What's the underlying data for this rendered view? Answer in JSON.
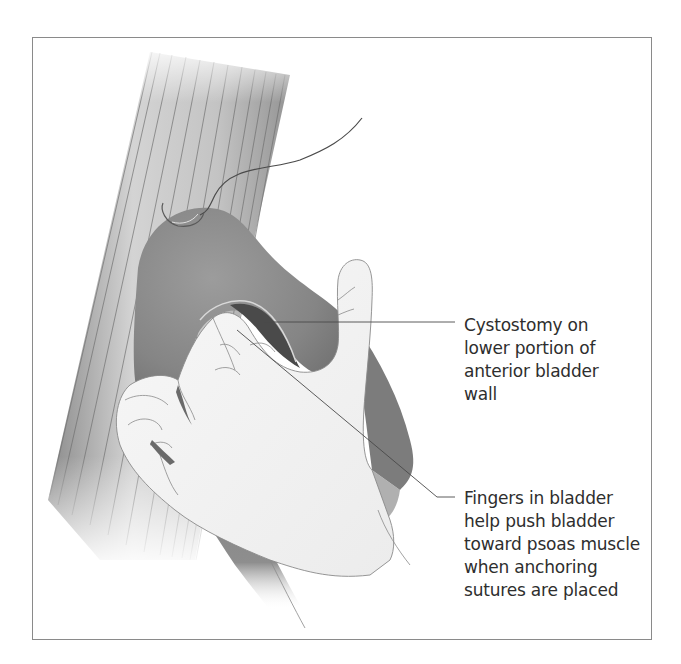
{
  "figure": {
    "colors": {
      "frame_border": "#8a8a8a",
      "muscle_shade": "#9a9a9a",
      "muscle_fiber_line": "#6e6e6e",
      "bladder": "#8c8c8c",
      "bladder_dark": "#5a5a5a",
      "hand": "#f4f4f4",
      "hand_outline": "#8a8a8a",
      "leader_line": "#4a4a4a",
      "text": "#2e2e2e"
    }
  },
  "labels": [
    {
      "id": "cystostomy",
      "lines": [
        "Cystostomy on",
        "lower portion of",
        "anterior bladder",
        "wall"
      ],
      "pointer_from": [
        264,
        322
      ],
      "pointer_to": [
        455,
        322
      ]
    },
    {
      "id": "fingers",
      "lines": [
        "Fingers in bladder",
        "help push bladder",
        "toward psoas muscle",
        "when anchoring",
        "sutures are placed"
      ],
      "pointer_from": [
        237,
        330
      ],
      "pointer_to": [
        455,
        497
      ]
    }
  ]
}
